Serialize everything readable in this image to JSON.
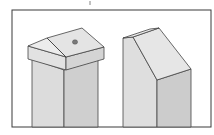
{
  "figure": {
    "posts": [
      {
        "name": "pitched-cap-post",
        "cap_style": "pitched cap with center hole"
      },
      {
        "name": "beveled-top-post",
        "cap_style": "single slanted bevel"
      }
    ]
  },
  "colors": {
    "background": "#ffffff",
    "frame": "#3a3a3a",
    "face_light": "#e6e6e6",
    "face_mid": "#d6d6d6",
    "face_dark": "#c4c4c4",
    "outline": "#444444",
    "hole": "#7a7a7a"
  }
}
